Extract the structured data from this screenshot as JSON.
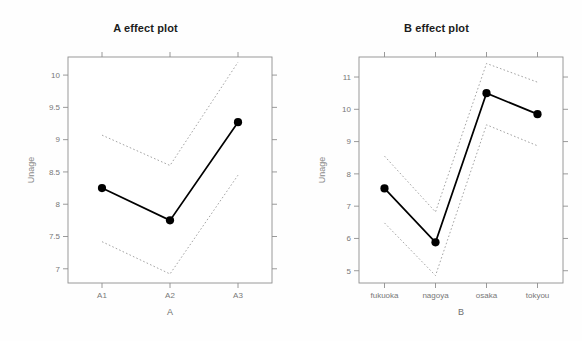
{
  "figure": {
    "background": "#fefefe",
    "panels": 2
  },
  "chart_data": [
    {
      "type": "line",
      "panel_id": "A",
      "title": "A effect plot",
      "xlabel": "A",
      "ylabel": "Unage",
      "categories": [
        "A1",
        "A2",
        "A3"
      ],
      "values": [
        8.25,
        7.75,
        9.27
      ],
      "series": [
        {
          "name": "fit",
          "values": [
            8.25,
            7.75,
            9.27
          ],
          "style": "solid",
          "marker": "filled-circle",
          "color": "#000000"
        },
        {
          "name": "upper confidence band",
          "values": [
            9.07,
            8.6,
            10.2
          ],
          "style": "dotted",
          "color": "#9a9a9a"
        },
        {
          "name": "lower confidence band",
          "values": [
            7.42,
            6.92,
            8.45
          ],
          "style": "dotted",
          "color": "#9a9a9a"
        }
      ],
      "yticks": [
        7,
        7.5,
        8,
        8.5,
        9,
        9.5,
        10
      ],
      "ytick_labels": [
        "7",
        "7.5",
        "8",
        "8.5",
        "9",
        "9.5",
        "10"
      ],
      "ylim": [
        6.78,
        10.28
      ],
      "grid": false,
      "legend": "none"
    },
    {
      "type": "line",
      "panel_id": "B",
      "title": "B effect plot",
      "xlabel": "B",
      "ylabel": "Unage",
      "categories": [
        "fukuoka",
        "nagoya",
        "osaka",
        "tokyou"
      ],
      "values": [
        7.55,
        5.88,
        10.5,
        9.85
      ],
      "series": [
        {
          "name": "fit",
          "values": [
            7.55,
            5.88,
            10.5,
            9.85
          ],
          "style": "solid",
          "marker": "filled-circle",
          "color": "#000000"
        },
        {
          "name": "upper confidence band",
          "values": [
            8.55,
            6.82,
            11.42,
            10.84
          ],
          "style": "dotted",
          "color": "#9a9a9a"
        },
        {
          "name": "lower confidence band",
          "values": [
            6.48,
            4.85,
            9.52,
            8.87
          ],
          "style": "dotted",
          "color": "#9a9a9a"
        }
      ],
      "yticks": [
        5,
        6,
        7,
        8,
        9,
        10,
        11
      ],
      "ytick_labels": [
        "5",
        "6",
        "7",
        "8",
        "9",
        "10",
        "11"
      ],
      "ylim": [
        4.62,
        11.62
      ],
      "grid": false,
      "legend": "none"
    }
  ]
}
